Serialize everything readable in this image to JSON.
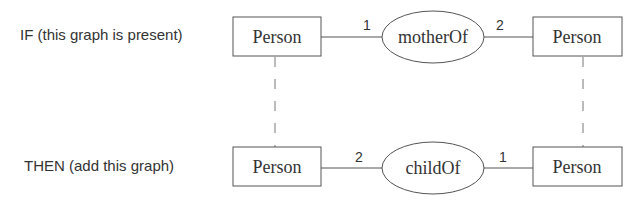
{
  "rows": {
    "if_label": "IF (this graph is present)",
    "then_label": "THEN (add this graph)"
  },
  "if_graph": {
    "left_node": "Person",
    "relation": "motherOf",
    "right_node": "Person",
    "left_edge_label": "1",
    "right_edge_label": "2"
  },
  "then_graph": {
    "left_node": "Person",
    "relation": "childOf",
    "right_node": "Person",
    "left_edge_label": "2",
    "right_edge_label": "1"
  }
}
